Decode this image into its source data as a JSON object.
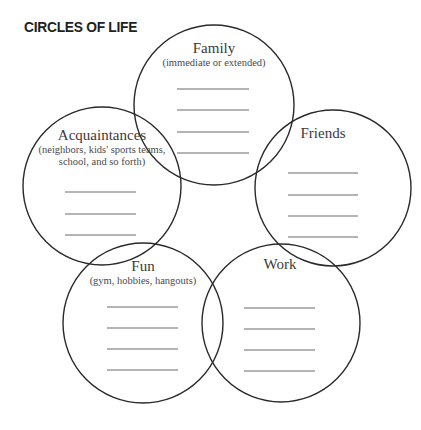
{
  "title": "CIRCLES OF LIFE",
  "colors": {
    "stroke": "#2a2a2a",
    "text": "#3a3a3a",
    "line": "#6a6a6a"
  },
  "circles": [
    {
      "name": "Family",
      "subtitle": [
        "(immediate or extended)"
      ],
      "blank_lines": 4
    },
    {
      "name": "Acquaintances",
      "subtitle": [
        "(neighbors, kids' sports teams,",
        "school, and so forth)"
      ],
      "blank_lines": 3
    },
    {
      "name": "Friends",
      "subtitle": [],
      "blank_lines": 4
    },
    {
      "name": "Fun",
      "subtitle": [
        "(gym, hobbies, hangouts)"
      ],
      "blank_lines": 4
    },
    {
      "name": "Work",
      "subtitle": [],
      "blank_lines": 4
    }
  ]
}
